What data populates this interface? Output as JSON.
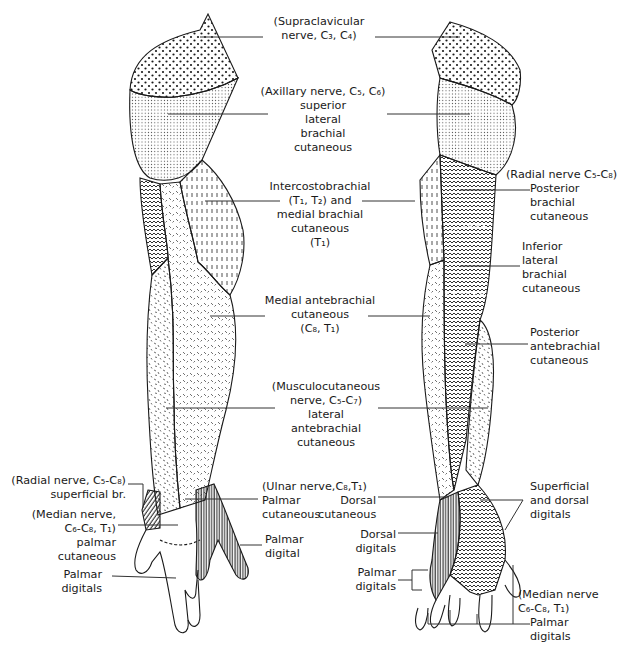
{
  "figure": {
    "views": [
      {
        "id": "anterior",
        "side": "left"
      },
      {
        "id": "posterior",
        "side": "right"
      }
    ],
    "colors": {
      "ink": "#1a1a1a",
      "background": "#ffffff",
      "leader": "#333333"
    },
    "patterns": {
      "supraclavicular": "coarse-dots",
      "axillary": "fine-dots",
      "intercostobrachial": "vertical-dashes",
      "radial_posterior_brachial": "chevron-zigzag",
      "medial_antebrachial": "diagonal-ticks",
      "lateral_antebrachial": "random-dashes",
      "ulnar": "vertical-lines",
      "radial_superficial": "diagonal-lines"
    }
  },
  "center_labels": [
    {
      "id": "supraclavicular",
      "lines": [
        "(Supraclavicular",
        "nerve, C₃, C₄)"
      ]
    },
    {
      "id": "axillary",
      "lines": [
        "(Axillary nerve, C₅, C₆)",
        "superior",
        "lateral",
        "brachial",
        "cutaneous"
      ]
    },
    {
      "id": "intercostobrachial",
      "lines": [
        "Intercostobrachial",
        "(T₁, T₂) and",
        "medial brachial",
        "cutaneous",
        "(T₁)"
      ]
    },
    {
      "id": "medial_antebrachial",
      "lines": [
        "Medial antebrachial",
        "cutaneous",
        "(C₈, T₁)"
      ]
    },
    {
      "id": "musculocutaneous",
      "lines": [
        "(Musculocutaneous",
        "nerve, C₅-C₇)",
        "lateral",
        "antebrachial",
        "cutaneous"
      ]
    }
  ],
  "right_labels": [
    {
      "id": "radial_posterior_brachial",
      "lines": [
        "(Radial nerve C₅-C₈)",
        "Posterior",
        "brachial",
        "cutaneous"
      ]
    },
    {
      "id": "inferior_lateral_brachial",
      "lines": [
        "Inferior",
        "lateral",
        "brachial",
        "cutaneous"
      ]
    },
    {
      "id": "posterior_antebrachial",
      "lines": [
        "Posterior",
        "antebrachial",
        "cutaneous"
      ]
    },
    {
      "id": "superficial_dorsal_digitals",
      "lines": [
        "Superficial",
        "and dorsal",
        "digitals"
      ]
    },
    {
      "id": "median_palmar_digitals_post",
      "lines": [
        "(Median nerve",
        "C₆-C₈, T₁)",
        "Palmar",
        "digitals"
      ]
    }
  ],
  "left_labels": [
    {
      "id": "radial_superficial",
      "lines": [
        "(Radial nerve, C₅-C₈)",
        "superficial br."
      ]
    },
    {
      "id": "median_palmar_cutaneous",
      "lines": [
        "(Median nerve,",
        "C₆-C₈, T₁)",
        "palmar",
        "cutaneous"
      ]
    },
    {
      "id": "palmar_digitals_ant",
      "lines": [
        "Palmar",
        "digitals"
      ]
    }
  ],
  "hand_labels": {
    "ulnar_header": "(Ulnar nerve,C₈,T₁)",
    "palmar_cutaneous": [
      "Palmar",
      "cutaneous"
    ],
    "dorsal_cutaneous": [
      "Dorsal",
      "cutaneous"
    ],
    "palmar_digital": [
      "Palmar",
      "digital"
    ],
    "dorsal_digitals": [
      "Dorsal",
      "digitals"
    ],
    "palmar_digitals": [
      "Palmar",
      "digitals"
    ]
  }
}
